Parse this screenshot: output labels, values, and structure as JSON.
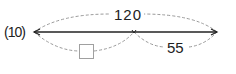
{
  "diagram": {
    "type": "number-line-segment",
    "start_label": "(10)",
    "total_label": "120",
    "right_segment_label": "55",
    "left_segment_label": "",
    "answer_box": "empty",
    "colors": {
      "main_line": "#222222",
      "dashed_arcs": "#9a9a9a",
      "answer_box_border": "#a0a0a0",
      "text": "#222222"
    }
  }
}
